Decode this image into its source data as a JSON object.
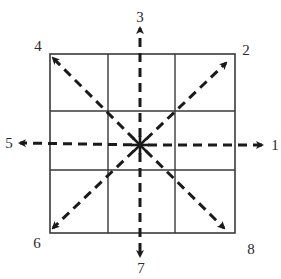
{
  "diagram": {
    "grid": {
      "rows": 3,
      "cols": 3,
      "line_color": "#3a3a3a",
      "outer": {
        "x1": 50,
        "y1": 54,
        "x2": 235,
        "y2": 233
      },
      "v_lines": [
        108,
        175
      ],
      "h_lines": [
        111,
        170
      ]
    },
    "center": {
      "x": 140,
      "y": 145
    },
    "arrow_color": "#1a1a1a",
    "directions": [
      {
        "id": "1",
        "label": "1",
        "direction": "east",
        "end": {
          "x": 262,
          "y": 145
        },
        "label_pos": {
          "x": 275,
          "y": 145
        }
      },
      {
        "id": "2",
        "label": "2",
        "direction": "north-east",
        "end": {
          "x": 226,
          "y": 63
        },
        "label_pos": {
          "x": 246,
          "y": 50
        }
      },
      {
        "id": "3",
        "label": "3",
        "direction": "north",
        "end": {
          "x": 140,
          "y": 28
        },
        "label_pos": {
          "x": 140,
          "y": 17
        }
      },
      {
        "id": "4",
        "label": "4",
        "direction": "north-west",
        "end": {
          "x": 53,
          "y": 58
        },
        "label_pos": {
          "x": 38,
          "y": 46
        }
      },
      {
        "id": "5",
        "label": "5",
        "direction": "west",
        "end": {
          "x": 20,
          "y": 143
        },
        "label_pos": {
          "x": 9,
          "y": 143
        }
      },
      {
        "id": "6",
        "label": "6",
        "direction": "south-west",
        "end": {
          "x": 53,
          "y": 228
        },
        "label_pos": {
          "x": 37,
          "y": 243
        }
      },
      {
        "id": "7",
        "label": "7",
        "direction": "south",
        "end": {
          "x": 140,
          "y": 256
        },
        "label_pos": {
          "x": 141,
          "y": 268
        }
      },
      {
        "id": "8",
        "label": "8",
        "direction": "south-east",
        "end": {
          "x": 224,
          "y": 228
        },
        "label_pos": {
          "x": 251,
          "y": 249
        }
      }
    ]
  }
}
